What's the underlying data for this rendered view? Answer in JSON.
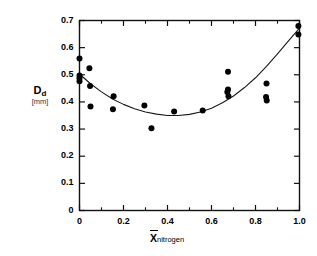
{
  "chart_data": {
    "type": "scatter",
    "title": "",
    "subtitle": "",
    "xlabel": "X̄",
    "xlabel_sub": "nitrogen",
    "xlabel_full": "X̄nitrogen",
    "ylabel": "D",
    "ylabel_sub": "d",
    "ylabel_unit": "[mm]",
    "ylabel_full": "Dd [mm]",
    "xlim": [
      0,
      1.0
    ],
    "ylim": [
      0,
      0.7
    ],
    "xticks": [
      0,
      0.2,
      0.4,
      0.6,
      0.8,
      1.0
    ],
    "xtick_labels": [
      "0",
      "0.2",
      "0.4",
      "0.6",
      "0.8",
      "1.0"
    ],
    "xminor_step": 0.1,
    "yticks": [
      0,
      0.1,
      0.2,
      0.3,
      0.4,
      0.5,
      0.6,
      0.7
    ],
    "ytick_labels": [
      "0",
      "0.1",
      "0.2",
      "0.3",
      "0.4",
      "0.5",
      "0.6",
      "0.7"
    ],
    "grid": false,
    "legend": null,
    "marker_color": "#000000",
    "curve_color": "#1a1a1a",
    "axis_color": "#111111",
    "background": "#ffffff",
    "points": [
      {
        "x": 0.0,
        "y": 0.56
      },
      {
        "x": 0.0,
        "y": 0.497
      },
      {
        "x": 0.0,
        "y": 0.487
      },
      {
        "x": 0.0,
        "y": 0.476
      },
      {
        "x": 0.045,
        "y": 0.524
      },
      {
        "x": 0.048,
        "y": 0.459
      },
      {
        "x": 0.05,
        "y": 0.383
      },
      {
        "x": 0.155,
        "y": 0.421
      },
      {
        "x": 0.152,
        "y": 0.373
      },
      {
        "x": 0.295,
        "y": 0.387
      },
      {
        "x": 0.327,
        "y": 0.303
      },
      {
        "x": 0.43,
        "y": 0.365
      },
      {
        "x": 0.56,
        "y": 0.368
      },
      {
        "x": 0.675,
        "y": 0.511
      },
      {
        "x": 0.675,
        "y": 0.446
      },
      {
        "x": 0.672,
        "y": 0.437
      },
      {
        "x": 0.677,
        "y": 0.421
      },
      {
        "x": 0.85,
        "y": 0.468
      },
      {
        "x": 0.848,
        "y": 0.418
      },
      {
        "x": 0.851,
        "y": 0.405
      },
      {
        "x": 0.995,
        "y": 0.68
      },
      {
        "x": 0.995,
        "y": 0.648
      }
    ],
    "fit_curve": {
      "description": "smooth U-shaped fitted curve through scatter",
      "points": [
        {
          "x": 0.0,
          "y": 0.503
        },
        {
          "x": 0.05,
          "y": 0.467
        },
        {
          "x": 0.1,
          "y": 0.437
        },
        {
          "x": 0.15,
          "y": 0.411
        },
        {
          "x": 0.2,
          "y": 0.391
        },
        {
          "x": 0.25,
          "y": 0.375
        },
        {
          "x": 0.3,
          "y": 0.363
        },
        {
          "x": 0.35,
          "y": 0.355
        },
        {
          "x": 0.4,
          "y": 0.35
        },
        {
          "x": 0.45,
          "y": 0.35
        },
        {
          "x": 0.5,
          "y": 0.354
        },
        {
          "x": 0.55,
          "y": 0.363
        },
        {
          "x": 0.6,
          "y": 0.377
        },
        {
          "x": 0.65,
          "y": 0.397
        },
        {
          "x": 0.7,
          "y": 0.422
        },
        {
          "x": 0.75,
          "y": 0.453
        },
        {
          "x": 0.8,
          "y": 0.489
        },
        {
          "x": 0.85,
          "y": 0.531
        },
        {
          "x": 0.9,
          "y": 0.577
        },
        {
          "x": 0.95,
          "y": 0.625
        },
        {
          "x": 1.0,
          "y": 0.672
        }
      ]
    }
  }
}
